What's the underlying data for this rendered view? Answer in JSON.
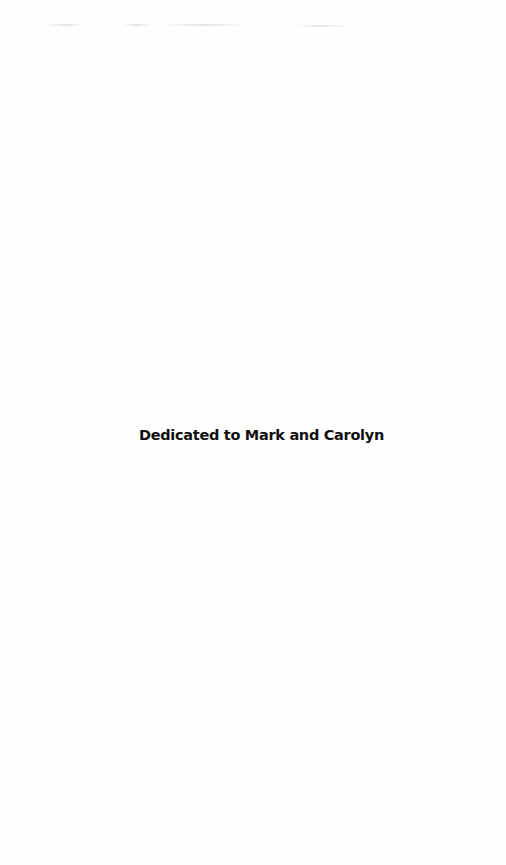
{
  "page": {
    "dedication": "Dedicated to Mark and Carolyn"
  },
  "colors": {
    "background": "#fefefe",
    "text": "#111111"
  }
}
